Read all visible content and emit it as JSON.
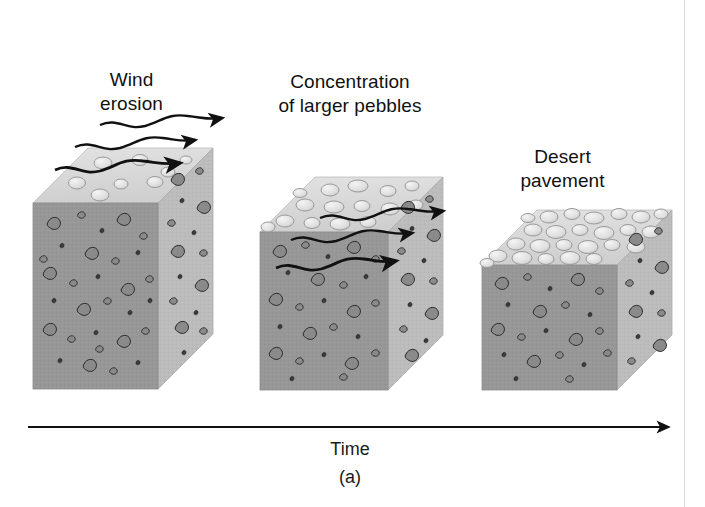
{
  "figure": {
    "caption": "(a)",
    "axis_label": "Time",
    "axis_arrow_direction": "right"
  },
  "panels": [
    {
      "id": "panel-wind-erosion",
      "label": "Wind\nerosion",
      "label_x": 64,
      "label_y": 68,
      "label_width": 135,
      "stage": 1,
      "wind_arrows": 3,
      "surface_pebbles": "sparse",
      "block": {
        "front_x": 33,
        "front_y": 203,
        "front_w": 125,
        "front_h": 186,
        "depth_x": 55,
        "depth_y": -55
      }
    },
    {
      "id": "panel-concentration",
      "label": "Concentration\nof larger pebbles",
      "label_x": 255,
      "label_y": 70,
      "label_width": 190,
      "stage": 2,
      "wind_arrows": 3,
      "surface_pebbles": "moderate",
      "block": {
        "front_x": 260,
        "front_y": 232,
        "front_w": 128,
        "front_h": 158,
        "depth_x": 55,
        "depth_y": -55
      }
    },
    {
      "id": "panel-desert-pavement",
      "label": "Desert\npavement",
      "label_x": 490,
      "label_y": 145,
      "label_width": 145,
      "stage": 3,
      "wind_arrows": 0,
      "surface_pebbles": "dense",
      "block": {
        "front_x": 482,
        "front_y": 265,
        "front_w": 135,
        "front_h": 125,
        "depth_x": 55,
        "depth_y": -55
      }
    }
  ],
  "colors": {
    "top_face": "#d7d7d7",
    "front_face": "#979797",
    "side_face": "#bcbcbc",
    "clast_fill": "#8a8a8a",
    "clast_stroke": "#2b2b2b",
    "pebble_fill": "#e6e6e6",
    "pebble_stroke": "#9a9a9a",
    "arrow": "#111111",
    "text": "#111111",
    "background": "#ffffff",
    "border": "#d9d9d9"
  }
}
